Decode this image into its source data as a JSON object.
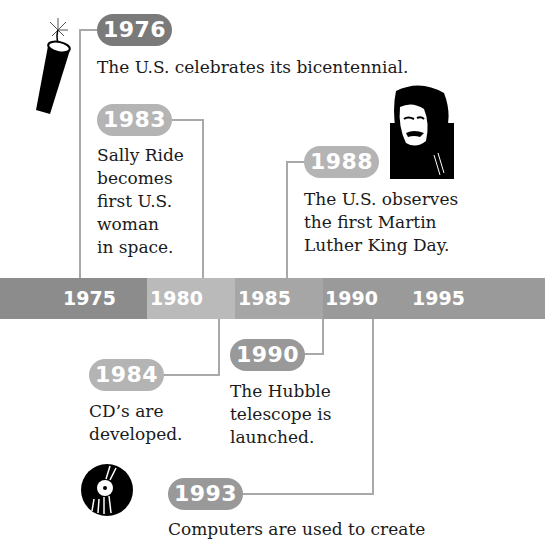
{
  "timeline": {
    "axis_ticks": [
      "1975",
      "1980",
      "1985",
      "1990",
      "1995"
    ],
    "colors": {
      "segment_1975": "#8c8c8c",
      "segment_1980": "#bababa",
      "segment_1985": "#a6a6a6",
      "segment_1990": "#9a9a9a",
      "pill_dark": "#7a7a7a",
      "pill_light": "#b4b4b4",
      "connector": "#a9a9a9"
    },
    "events": [
      {
        "year": "1976",
        "text": "The U.S. celebrates its bicentennial.",
        "icon": "firecracker-icon"
      },
      {
        "year": "1983",
        "lines": [
          "Sally Ride",
          "becomes",
          "first U.S.",
          "woman",
          "in space."
        ]
      },
      {
        "year": "1988",
        "lines": [
          "The U.S. observes",
          "the first Martin",
          "Luther King Day."
        ],
        "icon": "martin-luther-king-portrait"
      },
      {
        "year": "1984",
        "lines": [
          "CD’s are",
          "developed."
        ],
        "icon": "compact-disc-icon"
      },
      {
        "year": "1990",
        "lines": [
          "The Hubble",
          "telescope is",
          "launched."
        ]
      },
      {
        "year": "1993",
        "text": "Computers are used to create"
      }
    ]
  }
}
